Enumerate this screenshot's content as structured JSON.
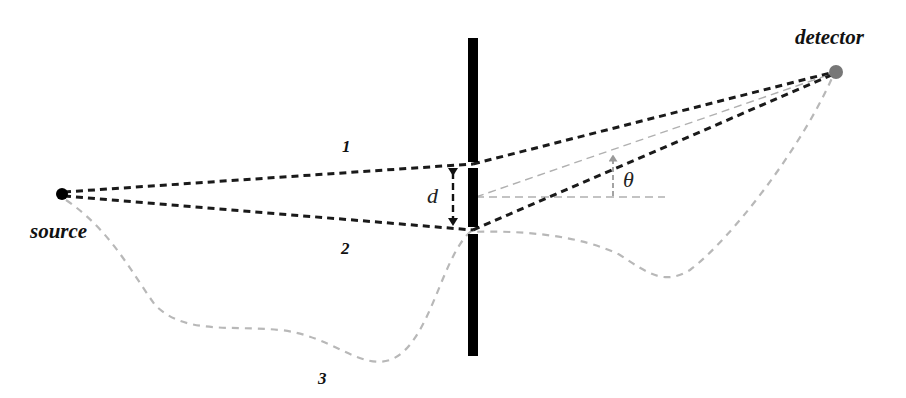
{
  "diagram": {
    "labels": {
      "source": "source",
      "detector": "detector",
      "path1": "1",
      "path2": "2",
      "path3": "3",
      "slit_separation": "d",
      "angle": "θ"
    },
    "colors": {
      "path_dark": "#1a1a1a",
      "path_light": "#b5b5b5",
      "barrier": "#000000",
      "source_dot": "#000000",
      "detector_dot": "#777777",
      "guide_line": "#aaaaaa"
    },
    "nodes": {
      "source": {
        "x": 62,
        "y": 194
      },
      "detector": {
        "x": 836,
        "y": 72
      },
      "slit1": {
        "x": 473,
        "y": 165
      },
      "slit2": {
        "x": 473,
        "y": 230
      }
    }
  }
}
